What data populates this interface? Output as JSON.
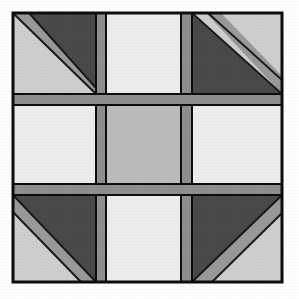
{
  "artwork": {
    "title": "Patchwork Quilt Block",
    "kind": "geometric-quilt-block",
    "canvas": {
      "width": 299,
      "height": 299,
      "background": "#ffffff"
    },
    "palette": {
      "outline": "#0d0d0d",
      "sashing_gray": "#8f8f8f",
      "dark_triangle": "#4a4a4a",
      "corner_light": "#cfcfcf",
      "panel_white": "#ededed",
      "panel_soft_white": "#e6e6e6",
      "center_gray": "#bcbcbc",
      "stripe_gray": "#9a9a9a"
    },
    "geometry": {
      "border_left": 13,
      "border_top": 13,
      "border_right": 282,
      "border_bottom": 282,
      "border_width": 2,
      "h_band_1_top": 94,
      "h_band_1_bottom": 105,
      "h_band_2_top": 184,
      "h_band_2_bottom": 195,
      "v_band_1_left": 96,
      "v_band_1_right": 106,
      "v_band_2_left": 181,
      "v_band_2_right": 192
    },
    "cells": [
      {
        "id": "top-left",
        "name": "corner-block-top-left",
        "row": 0,
        "col": 0,
        "fill": "#cfcfcf",
        "motif": "diagonal-triangle",
        "triangle_corner": "top-right",
        "stripe": true
      },
      {
        "id": "top-center",
        "name": "panel-top-center",
        "row": 0,
        "col": 1,
        "fill": "#ededed",
        "motif": "plain",
        "triangle_corner": "",
        "stripe": false
      },
      {
        "id": "top-right",
        "name": "corner-block-top-right",
        "row": 0,
        "col": 2,
        "fill": "#cfcfcf",
        "motif": "diagonal-triangle",
        "triangle_corner": "top-left",
        "stripe": true
      },
      {
        "id": "middle-left",
        "name": "panel-middle-left",
        "row": 1,
        "col": 0,
        "fill": "#ededed",
        "motif": "plain",
        "triangle_corner": "",
        "stripe": false
      },
      {
        "id": "center",
        "name": "panel-center",
        "row": 1,
        "col": 1,
        "fill": "#bcbcbc",
        "motif": "plain",
        "triangle_corner": "",
        "stripe": false
      },
      {
        "id": "middle-right",
        "name": "panel-middle-right",
        "row": 1,
        "col": 2,
        "fill": "#ededed",
        "motif": "plain",
        "triangle_corner": "",
        "stripe": false
      },
      {
        "id": "bottom-left",
        "name": "corner-block-bottom-left",
        "row": 2,
        "col": 0,
        "fill": "#cfcfcf",
        "motif": "diagonal-triangle",
        "triangle_corner": "top-right",
        "stripe": true
      },
      {
        "id": "bottom-center",
        "name": "panel-bottom-center",
        "row": 2,
        "col": 1,
        "fill": "#ededed",
        "motif": "plain",
        "triangle_corner": "",
        "stripe": false
      },
      {
        "id": "bottom-right",
        "name": "corner-block-bottom-right",
        "row": 2,
        "col": 2,
        "fill": "#cfcfcf",
        "motif": "diagonal-triangle",
        "triangle_corner": "top-left",
        "stripe": true
      }
    ],
    "sashing": {
      "horizontal_bands": 2,
      "vertical_bands": 2,
      "fill": "#8f8f8f"
    }
  }
}
